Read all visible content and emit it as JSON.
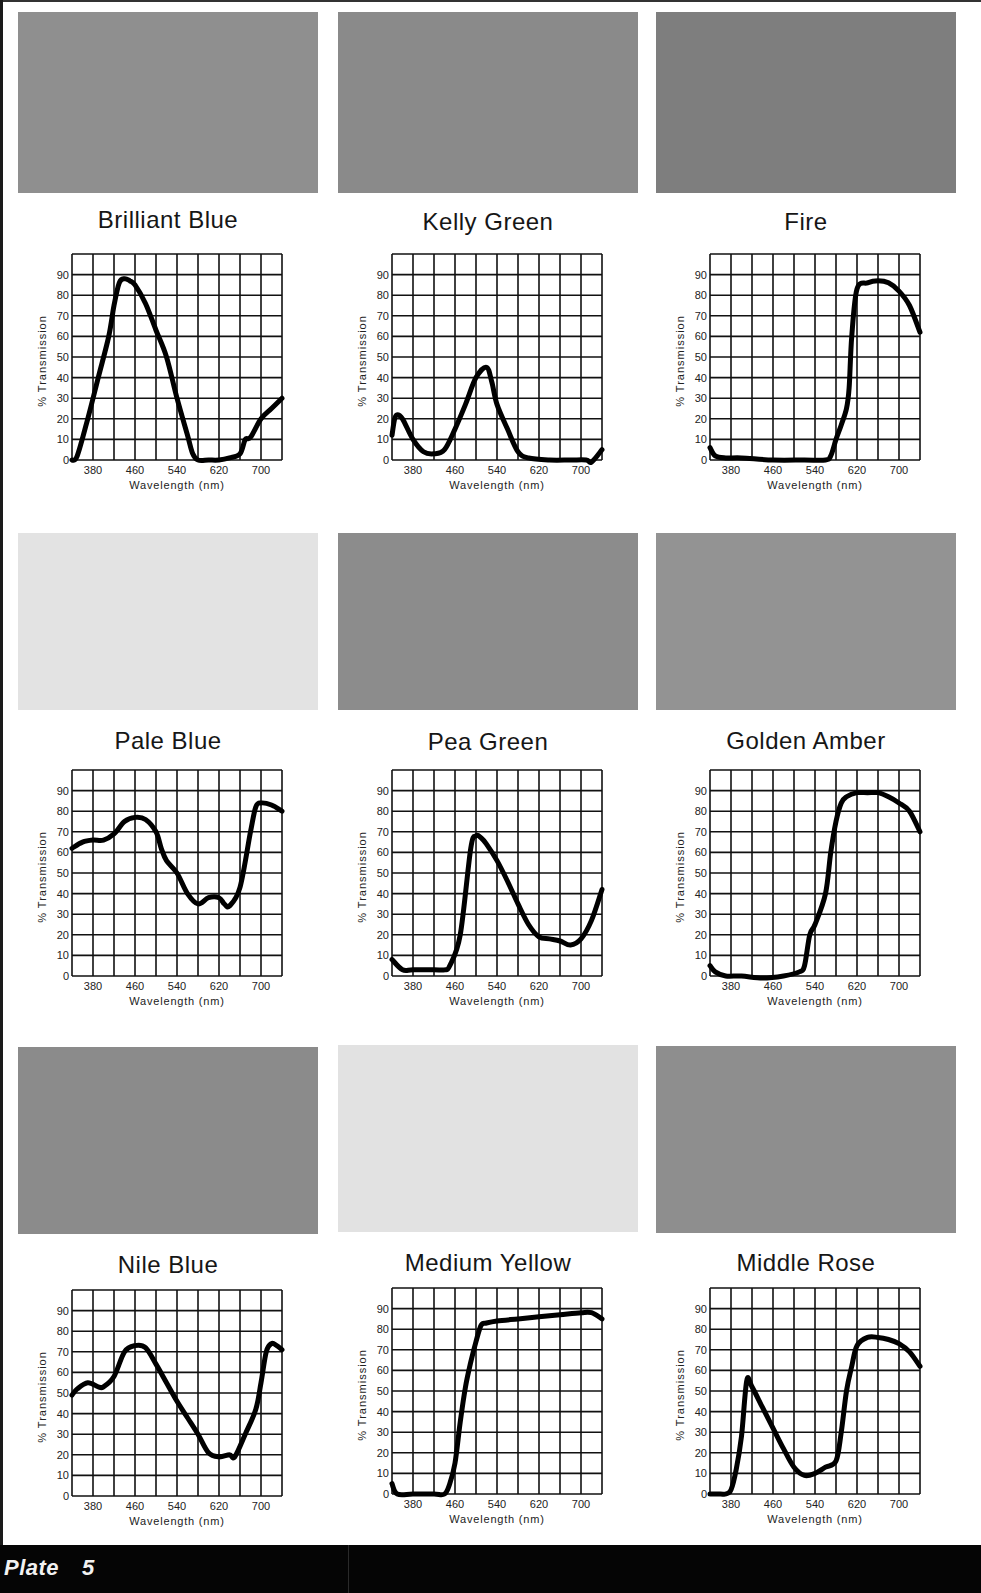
{
  "plate": {
    "label": "Plate",
    "number": "5"
  },
  "axes": {
    "ylabel": "% Transmission",
    "xlabel": "Wavelength (nm)",
    "x_ticks": [
      "380",
      "460",
      "540",
      "620",
      "700"
    ],
    "y_ticks": [
      "0",
      "10",
      "20",
      "30",
      "40",
      "50",
      "60",
      "70",
      "80",
      "90"
    ]
  },
  "filters": [
    {
      "name": "Brilliant Blue",
      "swatch_color": "#8f8f8f"
    },
    {
      "name": "Kelly Green",
      "swatch_color": "#8a8a8a"
    },
    {
      "name": "Fire",
      "swatch_color": "#7e7e7e"
    },
    {
      "name": "Pale Blue",
      "swatch_color": "#e3e3e3"
    },
    {
      "name": "Pea Green",
      "swatch_color": "#8c8c8c"
    },
    {
      "name": "Golden Amber",
      "swatch_color": "#939393"
    },
    {
      "name": "Nile Blue",
      "swatch_color": "#8b8b8b"
    },
    {
      "name": "Medium Yellow",
      "swatch_color": "#e2e2e2"
    },
    {
      "name": "Middle Rose",
      "swatch_color": "#8e8e8e"
    }
  ],
  "chart_data": [
    {
      "type": "line",
      "title": "Brilliant Blue",
      "xlabel": "Wavelength (nm)",
      "ylabel": "% Transmission",
      "xlim": [
        340,
        740
      ],
      "ylim": [
        0,
        100
      ],
      "grid": true,
      "x_ticks": [
        380,
        460,
        540,
        620,
        700
      ],
      "y_ticks": [
        0,
        10,
        20,
        30,
        40,
        50,
        60,
        70,
        80,
        90
      ],
      "x": [
        340,
        350,
        370,
        390,
        410,
        420,
        430,
        440,
        450,
        460,
        480,
        500,
        520,
        540,
        560,
        570,
        580,
        600,
        620,
        640,
        660,
        670,
        680,
        700,
        720,
        740
      ],
      "values": [
        0,
        2,
        20,
        40,
        60,
        75,
        86,
        88,
        87,
        85,
        76,
        63,
        50,
        30,
        12,
        3,
        0,
        0,
        0,
        1,
        3,
        10,
        11,
        20,
        25,
        30
      ]
    },
    {
      "type": "line",
      "title": "Kelly Green",
      "xlabel": "Wavelength (nm)",
      "ylabel": "% Transmission",
      "xlim": [
        340,
        740
      ],
      "ylim": [
        0,
        100
      ],
      "grid": true,
      "x_ticks": [
        380,
        460,
        540,
        620,
        700
      ],
      "y_ticks": [
        0,
        10,
        20,
        30,
        40,
        50,
        60,
        70,
        80,
        90
      ],
      "x": [
        340,
        345,
        350,
        360,
        380,
        400,
        420,
        440,
        460,
        480,
        500,
        520,
        530,
        540,
        560,
        580,
        600,
        640,
        680,
        710,
        720,
        740
      ],
      "values": [
        12,
        20,
        22,
        20,
        10,
        4,
        3,
        5,
        15,
        27,
        40,
        45,
        38,
        27,
        15,
        4,
        1,
        0,
        0,
        0,
        -1,
        5
      ]
    },
    {
      "type": "line",
      "title": "Fire",
      "xlabel": "Wavelength (nm)",
      "ylabel": "% Transmission",
      "xlim": [
        340,
        740
      ],
      "ylim": [
        0,
        100
      ],
      "grid": true,
      "x_ticks": [
        380,
        460,
        540,
        620,
        700
      ],
      "y_ticks": [
        0,
        10,
        20,
        30,
        40,
        50,
        60,
        70,
        80,
        90
      ],
      "x": [
        340,
        350,
        370,
        400,
        460,
        520,
        560,
        570,
        580,
        590,
        600,
        605,
        610,
        620,
        640,
        660,
        680,
        700,
        720,
        740
      ],
      "values": [
        6,
        2,
        1,
        1,
        0,
        0,
        0,
        2,
        10,
        17,
        25,
        35,
        60,
        83,
        86,
        87,
        86,
        82,
        75,
        62
      ]
    },
    {
      "type": "line",
      "title": "Pale Blue",
      "xlabel": "Wavelength (nm)",
      "ylabel": "% Transmission",
      "xlim": [
        340,
        740
      ],
      "ylim": [
        0,
        100
      ],
      "grid": true,
      "x_ticks": [
        380,
        460,
        540,
        620,
        700
      ],
      "y_ticks": [
        0,
        10,
        20,
        30,
        40,
        50,
        60,
        70,
        80,
        90
      ],
      "x": [
        340,
        360,
        380,
        400,
        420,
        440,
        460,
        480,
        500,
        510,
        520,
        540,
        560,
        580,
        600,
        620,
        630,
        640,
        660,
        680,
        690,
        700,
        720,
        740
      ],
      "values": [
        62,
        65,
        66,
        66,
        69,
        75,
        77,
        76,
        70,
        62,
        56,
        50,
        40,
        35,
        38,
        38,
        35,
        34,
        43,
        70,
        82,
        84,
        83,
        80
      ]
    },
    {
      "type": "line",
      "title": "Pea Green",
      "xlabel": "Wavelength (nm)",
      "ylabel": "% Transmission",
      "xlim": [
        340,
        740
      ],
      "ylim": [
        0,
        100
      ],
      "grid": true,
      "x_ticks": [
        380,
        460,
        540,
        620,
        700
      ],
      "y_ticks": [
        0,
        10,
        20,
        30,
        40,
        50,
        60,
        70,
        80,
        90
      ],
      "x": [
        340,
        360,
        380,
        420,
        440,
        450,
        470,
        490,
        500,
        510,
        520,
        540,
        560,
        580,
        600,
        620,
        640,
        660,
        680,
        700,
        720,
        740
      ],
      "values": [
        8,
        3,
        3,
        3,
        3,
        5,
        20,
        62,
        68,
        67,
        64,
        56,
        46,
        35,
        25,
        19,
        18,
        17,
        15,
        18,
        27,
        42
      ]
    },
    {
      "type": "line",
      "title": "Golden Amber",
      "xlabel": "Wavelength (nm)",
      "ylabel": "% Transmission",
      "xlim": [
        340,
        740
      ],
      "ylim": [
        0,
        100
      ],
      "grid": true,
      "x_ticks": [
        380,
        460,
        540,
        620,
        700
      ],
      "y_ticks": [
        0,
        10,
        20,
        30,
        40,
        50,
        60,
        70,
        80,
        90
      ],
      "x": [
        340,
        350,
        370,
        400,
        440,
        480,
        510,
        520,
        530,
        540,
        560,
        570,
        580,
        590,
        600,
        620,
        640,
        660,
        680,
        700,
        720,
        740
      ],
      "values": [
        5,
        2,
        0,
        0,
        -1,
        0,
        2,
        5,
        20,
        25,
        40,
        60,
        75,
        84,
        87,
        89,
        89,
        89,
        87,
        84,
        80,
        70
      ]
    },
    {
      "type": "line",
      "title": "Nile Blue",
      "xlabel": "Wavelength (nm)",
      "ylabel": "% Transmission",
      "xlim": [
        340,
        740
      ],
      "ylim": [
        0,
        100
      ],
      "grid": true,
      "x_ticks": [
        380,
        460,
        540,
        620,
        700
      ],
      "y_ticks": [
        0,
        10,
        20,
        30,
        40,
        50,
        60,
        70,
        80,
        90
      ],
      "x": [
        340,
        350,
        370,
        390,
        400,
        420,
        440,
        460,
        480,
        500,
        520,
        540,
        560,
        580,
        600,
        620,
        640,
        650,
        670,
        690,
        700,
        710,
        720,
        730,
        740
      ],
      "values": [
        49,
        52,
        55,
        53,
        53,
        58,
        70,
        73,
        72,
        64,
        55,
        46,
        38,
        30,
        21,
        19,
        20,
        19,
        30,
        42,
        55,
        70,
        74,
        73,
        71
      ]
    },
    {
      "type": "line",
      "title": "Medium Yellow",
      "xlabel": "Wavelength (nm)",
      "ylabel": "% Transmission",
      "xlim": [
        340,
        740
      ],
      "ylim": [
        0,
        100
      ],
      "grid": true,
      "x_ticks": [
        380,
        460,
        540,
        620,
        700
      ],
      "y_ticks": [
        0,
        10,
        20,
        30,
        40,
        50,
        60,
        70,
        80,
        90
      ],
      "x": [
        340,
        350,
        380,
        420,
        440,
        450,
        460,
        470,
        480,
        490,
        500,
        510,
        520,
        540,
        580,
        620,
        660,
        700,
        720,
        740
      ],
      "values": [
        5,
        0,
        0,
        0,
        0,
        5,
        15,
        35,
        52,
        64,
        74,
        82,
        83,
        84,
        85,
        86,
        87,
        88,
        88,
        85
      ]
    },
    {
      "type": "line",
      "title": "Middle Rose",
      "xlabel": "Wavelength (nm)",
      "ylabel": "% Transmission",
      "xlim": [
        340,
        740
      ],
      "ylim": [
        0,
        100
      ],
      "grid": true,
      "x_ticks": [
        380,
        460,
        540,
        620,
        700
      ],
      "y_ticks": [
        0,
        10,
        20,
        30,
        40,
        50,
        60,
        70,
        80,
        90
      ],
      "x": [
        340,
        360,
        370,
        380,
        390,
        400,
        410,
        420,
        440,
        460,
        480,
        500,
        520,
        540,
        560,
        580,
        590,
        600,
        610,
        620,
        640,
        660,
        680,
        700,
        720,
        740
      ],
      "values": [
        0,
        0,
        0,
        2,
        12,
        28,
        55,
        52,
        42,
        32,
        22,
        13,
        9,
        10,
        13,
        16,
        30,
        50,
        62,
        72,
        76,
        76,
        75,
        73,
        69,
        62
      ]
    }
  ]
}
